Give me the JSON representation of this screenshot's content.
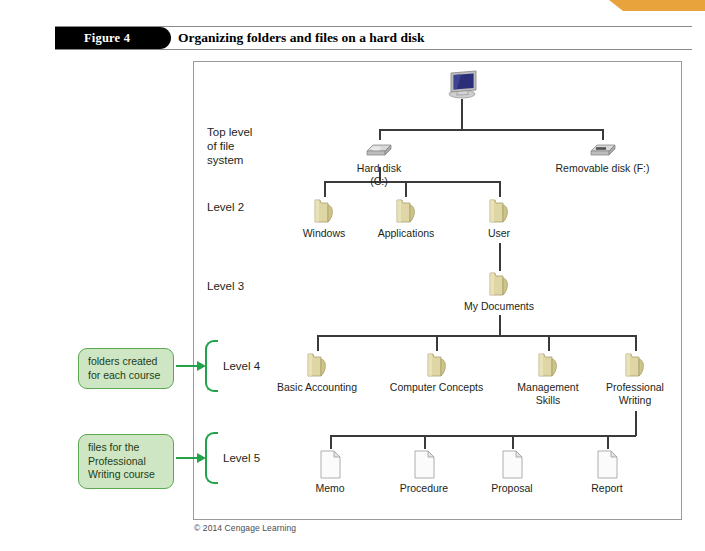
{
  "figure": {
    "tab_label": "Figure 4",
    "title": "Organizing folders and files on a hard disk",
    "copyright": "© 2014 Cengage Learning"
  },
  "colors": {
    "accent_orange": "#e8a33d",
    "callout_fill": "#cfe6c4",
    "callout_border": "#5aa84f",
    "arrow_green": "#22a24a",
    "folder_yellow": "#d8d09a",
    "line_gray": "#3a3a3a"
  },
  "levels": [
    {
      "id": "top",
      "label": "Top level\nof file\nsystem"
    },
    {
      "id": "level2",
      "label": "Level 2"
    },
    {
      "id": "level3",
      "label": "Level 3"
    },
    {
      "id": "level4",
      "label": "Level 4"
    },
    {
      "id": "level5",
      "label": "Level 5"
    }
  ],
  "callouts": [
    {
      "id": "callout-level4",
      "text": "folders created\nfor each course"
    },
    {
      "id": "callout-level5",
      "text": "files for the\nProfessional\nWriting course"
    }
  ],
  "tree": {
    "root": {
      "icon": "computer-icon",
      "label": ""
    },
    "level2_disks": [
      {
        "icon": "hard-disk-icon",
        "label": "Hard disk (C:)"
      },
      {
        "icon": "removable-disk-icon",
        "label": "Removable disk (F:)"
      }
    ],
    "level2_folders": [
      {
        "icon": "folder-icon",
        "label": "Windows"
      },
      {
        "icon": "folder-icon",
        "label": "Applications"
      },
      {
        "icon": "folder-icon",
        "label": "User"
      }
    ],
    "level3_folders": [
      {
        "icon": "folder-icon",
        "label": "My Documents"
      }
    ],
    "level4_folders": [
      {
        "icon": "folder-icon",
        "label": "Basic Accounting"
      },
      {
        "icon": "folder-icon",
        "label": "Computer Concepts"
      },
      {
        "icon": "folder-icon",
        "label": "Management\nSkills"
      },
      {
        "icon": "folder-icon",
        "label": "Professional\nWriting"
      }
    ],
    "level5_files": [
      {
        "icon": "document-icon",
        "label": "Memo"
      },
      {
        "icon": "document-icon",
        "label": "Procedure"
      },
      {
        "icon": "document-icon",
        "label": "Proposal"
      },
      {
        "icon": "document-icon",
        "label": "Report"
      }
    ]
  }
}
